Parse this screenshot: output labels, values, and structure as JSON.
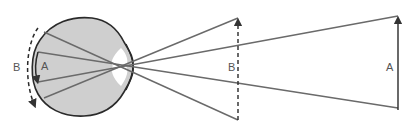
{
  "diagram": {
    "type": "optics-eye-projection",
    "labels": {
      "retina_near": "A",
      "retina_far": "B",
      "object_near": "B",
      "object_far": "A"
    },
    "colors": {
      "eye_fill": "#cfcfcf",
      "outline": "#2a2a2a",
      "ray": "#6a6a6a",
      "pupil": "#ffffff",
      "text": "#555555"
    },
    "elements": [
      "eyeball",
      "pupil-lens",
      "light-rays",
      "retinal-image-A-arrow",
      "retinal-image-B-dashed-arc",
      "object-B-dashed-arrow",
      "object-A-solid-arrow"
    ]
  }
}
